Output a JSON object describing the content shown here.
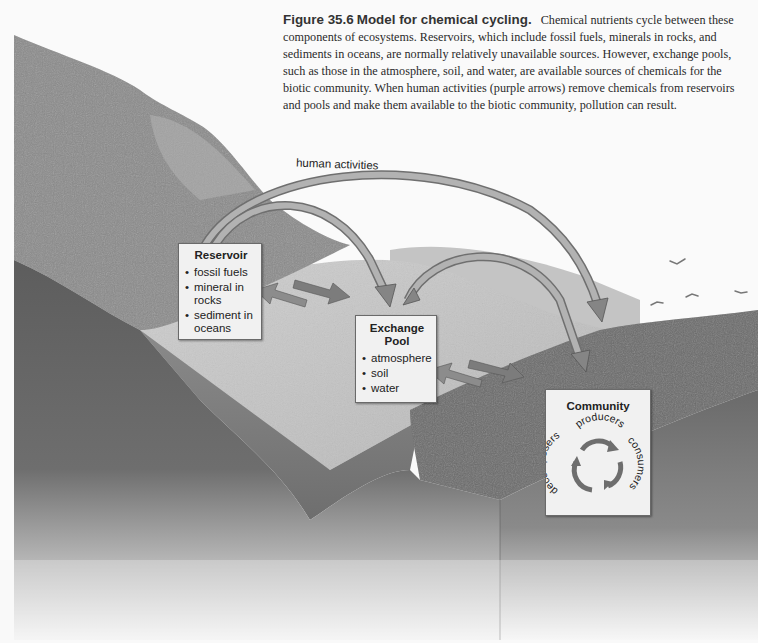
{
  "figure": {
    "number": "Figure 35.6",
    "title": "Model for chemical cycling.",
    "caption": "Chemical nutrients cycle between these components of ecosystems. Reservoirs, which include fossil fuels, minerals in rocks, and sediments in oceans, are normally relatively unavailable sources. However, exchange pools, such as those in the atmosphere, soil, and water, are available sources of chemicals for the biotic community. When human activities (purple arrows) remove chemicals from reservoirs and pools and make them available to the biotic community, pollution can result."
  },
  "arrows": {
    "human_activities_label": "human activities"
  },
  "reservoir": {
    "title": "Reservoir",
    "items": [
      "fossil fuels",
      "mineral in rocks",
      "sediment in oceans"
    ]
  },
  "exchange_pool": {
    "title": "Exchange Pool",
    "items": [
      "atmosphere",
      "soil",
      "water"
    ]
  },
  "community": {
    "title": "Community",
    "cycle": [
      "producers",
      "consumers",
      "decomposers"
    ]
  },
  "colors": {
    "background": "#fafafa",
    "box_fill": "#f1f1f1",
    "arrow_fill": "#8c8c8c",
    "text": "#222222"
  }
}
